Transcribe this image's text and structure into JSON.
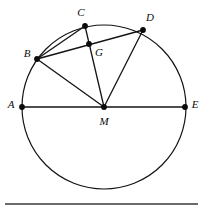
{
  "figure": {
    "kind": "circle-geometry-diagram",
    "canvas": {
      "width": 204,
      "height": 212
    },
    "colors": {
      "stroke": "#141414",
      "point_fill": "#0b0b0b",
      "label_text": "#0b0b0b",
      "background": "#ffffff",
      "rule": "#3a3a3a"
    },
    "circle": {
      "name": "main-circle",
      "center_label": "M",
      "cx": 104,
      "cy": 107,
      "r": 82,
      "stroke_width": 1.2
    },
    "points": [
      {
        "id": "A",
        "label": "A",
        "x": 22,
        "y": 107,
        "label_x": 11,
        "label_y": 104,
        "on_circle": true
      },
      {
        "id": "B",
        "label": "B",
        "x": 37,
        "y": 59,
        "label_x": 27,
        "label_y": 53,
        "on_circle": true
      },
      {
        "id": "C",
        "label": "C",
        "x": 85,
        "y": 26,
        "label_x": 81,
        "label_y": 12,
        "on_circle": true
      },
      {
        "id": "D",
        "label": "D",
        "x": 143,
        "y": 30,
        "label_x": 150,
        "label_y": 17,
        "on_circle": true
      },
      {
        "id": "E",
        "label": "E",
        "x": 185,
        "y": 107,
        "label_x": 195,
        "label_y": 104,
        "on_circle": true
      },
      {
        "id": "M",
        "label": "M",
        "x": 104,
        "y": 107,
        "label_x": 104,
        "label_y": 121,
        "on_circle": false
      },
      {
        "id": "G",
        "label": "G",
        "x": 89,
        "y": 44,
        "label_x": 99,
        "label_y": 52,
        "on_circle": false
      }
    ],
    "point_radius": 2.9,
    "segments": [
      {
        "id": "seg-AE",
        "from": "A",
        "to": "E",
        "label": "A-E diameter"
      },
      {
        "id": "seg-MB",
        "from": "M",
        "to": "B",
        "label": "M-B radius"
      },
      {
        "id": "seg-MC",
        "from": "M",
        "to": "C",
        "label": "M-C radius through G"
      },
      {
        "id": "seg-MD",
        "from": "M",
        "to": "D",
        "label": "M-D radius"
      },
      {
        "id": "seg-BD",
        "from": "B",
        "to": "D",
        "label": "B-D chord through G"
      },
      {
        "id": "seg-BC",
        "from": "B",
        "to": "C",
        "label": "B-C chord"
      }
    ],
    "bottom_rule": {
      "x1": 5,
      "x2": 198,
      "y": 204,
      "stroke_width": 1.6
    }
  }
}
